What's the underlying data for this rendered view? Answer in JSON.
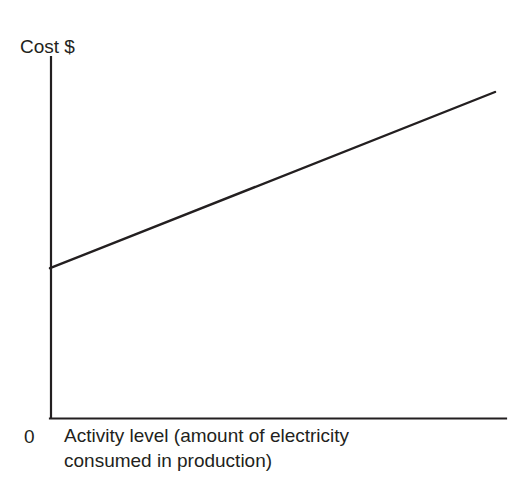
{
  "figure": {
    "top_clipped_text": "· · ·",
    "y_axis_label": "Cost $",
    "origin_label": "0",
    "x_axis_label_line1": "Activity level  (amount of electricity",
    "x_axis_label_line2": "consumed in production)",
    "line_color": "#231f20",
    "axis_color": "#231f20",
    "background_color": "#ffffff"
  },
  "chart_data": {
    "type": "line",
    "title": "",
    "subtitle": "",
    "xlabel": "Activity level  (amount of electricity consumed in production)",
    "ylabel": "Cost $",
    "xlim": [
      0,
      100
    ],
    "ylim": [
      0,
      100
    ],
    "grid": false,
    "legend": null,
    "xticks": [
      "0"
    ],
    "yticks": [],
    "annotations": [],
    "series": [
      {
        "name": "Semi-variable cost",
        "x": [
          0,
          100
        ],
        "values": [
          41.5,
          90.3
        ],
        "intercept": 41.5,
        "slope": 0.488,
        "style": "solid",
        "color": "#231f20"
      }
    ]
  }
}
